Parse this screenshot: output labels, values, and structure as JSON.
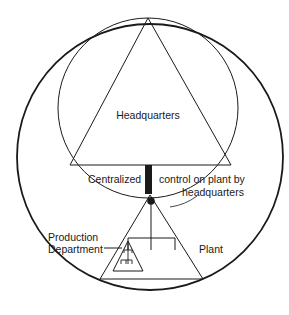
{
  "diagram": {
    "labels": {
      "headquarters": "Headquarters",
      "centralized": "Centralized",
      "control_line1": "control on plant by",
      "control_line2": "headquarters",
      "production_line1": "Production",
      "production_line2": "Department",
      "plant": "Plant"
    },
    "colors": {
      "line": "#1a1a1a",
      "background": "#ffffff",
      "bar": "#1a1a1a"
    }
  }
}
